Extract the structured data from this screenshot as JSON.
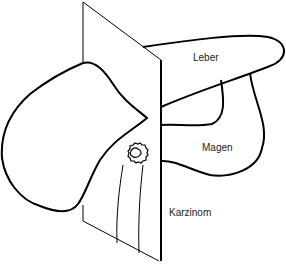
{
  "diagram": {
    "type": "anatomical-illustration",
    "labels": {
      "liver": "Leber",
      "stomach": "Magen",
      "carcinoma": "Karzinom"
    },
    "colors": {
      "stroke": "#000000",
      "background": "#ffffff",
      "text": "#222222"
    }
  }
}
